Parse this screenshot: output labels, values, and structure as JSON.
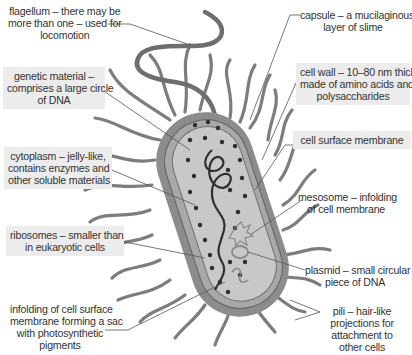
{
  "diagram": {
    "labels": {
      "flagellum": [
        "flagellum – there may be",
        "more than one – used for",
        "locomotion"
      ],
      "genetic_material": [
        "genetic material –",
        "comprises a large circle",
        "of DNA"
      ],
      "cytoplasm": [
        "cytoplasm – jelly-like,",
        "contains enzymes and",
        "other soluble materials"
      ],
      "ribosomes": [
        "ribosomes – smaller than",
        "in eukaryotic cells"
      ],
      "infolding": [
        "infolding of cell surface",
        "membrane forming a sac",
        "with photosynthetic",
        "pigments"
      ],
      "capsule": [
        "capsule – a mucilaginous",
        "layer of slime"
      ],
      "cell_wall": [
        "cell wall – 10–80 nm thick,",
        "made of amino acids and",
        "polysaccharides"
      ],
      "cell_surface_membrane": [
        "cell surface membrane"
      ],
      "mesosome": [
        "mesosome – infolding",
        "of cell membrane"
      ],
      "plasmid": [
        "plasmid – small circular",
        "piece of DNA"
      ],
      "pili": [
        "pili – hair-like",
        "projections for",
        "attachment to",
        "other cells"
      ]
    },
    "colors": {
      "label_box": "#ececec",
      "cell_outer": "#8c8c8c",
      "cell_inner": "#bdbdbd",
      "cytoplasm": "#c8c8c8",
      "pili": "#7d7d7d",
      "leader_line": "#555555"
    }
  }
}
